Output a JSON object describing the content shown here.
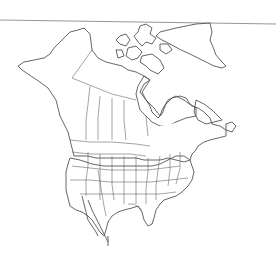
{
  "map": {
    "type": "range-map",
    "region": "North America",
    "legend_visible": false,
    "zones": [
      {
        "id": "summer-range",
        "color": "#dadada",
        "areas": [
          "Alaska",
          "western and central Canada",
          "southern Ontario/Quebec",
          "Labrador",
          "Newfoundland",
          "northern United States"
        ]
      },
      {
        "id": "year-round-range",
        "color": "#a0a0a0",
        "areas": [
          "southern and central United States",
          "California",
          "Texas",
          "Florida",
          "southeastern United States"
        ]
      },
      {
        "id": "outside-range",
        "color": "#ffffff",
        "areas": [
          "Arctic archipelago",
          "Greenland",
          "Hudson Bay region",
          "northern Quebec",
          "New England coast",
          "Mexico"
        ]
      }
    ],
    "colors": {
      "background": "#ffffff",
      "summer": "#dadada",
      "year_round": "#a0a0a0",
      "outline": "#555555"
    }
  }
}
